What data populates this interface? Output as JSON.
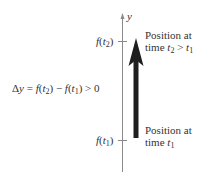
{
  "diagram": {
    "axis_label": "y",
    "tick_top_label": "f(t2)",
    "tick_bottom_label": "f(t1)",
    "delta_label": "Δy = f(t2) − f(t1) > 0",
    "top_note_line1": "Position at",
    "top_note_line2": "time t2 > t1",
    "bottom_note_line1": "Position at",
    "bottom_note_line2": "time t1",
    "colors": {
      "axis": "#8a8a8a",
      "arrow": "#1e1e1e",
      "text": "#333333"
    }
  }
}
